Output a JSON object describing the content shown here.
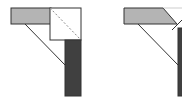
{
  "diagram": {
    "title": "",
    "colors": {
      "light_gray": "#b4b4b4",
      "dark_gray": "#404040",
      "outline": "#333333",
      "white": "#ffffff"
    },
    "figures": [
      {
        "id": "left",
        "description": "Horizontal light-gray bar joined to vertical dark bar via white corner square with dashed diagonal; a thin diagonal brace connects the bars"
      },
      {
        "id": "right",
        "description": "Horizontal light-gray bar with mitred end meeting vertical dark bar; a thin diagonal brace connects the bars"
      }
    ]
  }
}
